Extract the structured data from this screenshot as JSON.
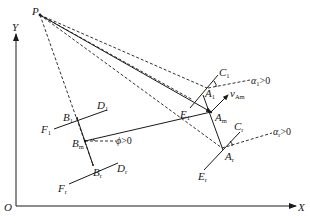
{
  "figure": {
    "type": "geometric-diagram",
    "background": "#ffffff",
    "stroke_color": "#1a1a1a"
  },
  "axes": {
    "origin_label": "O",
    "x_label": "X",
    "y_label": "Y"
  },
  "points": {
    "P": {
      "base": "P",
      "sub": ""
    },
    "C1": {
      "base": "C",
      "sub": "1"
    },
    "A1": {
      "base": "A",
      "sub": "1"
    },
    "Am": {
      "base": "A",
      "sub": "m"
    },
    "Ar": {
      "base": "A",
      "sub": "r"
    },
    "Cr": {
      "base": "C",
      "sub": "r"
    },
    "E1": {
      "base": "E",
      "sub": "1"
    },
    "Er": {
      "base": "E",
      "sub": "r"
    },
    "D1": {
      "base": "D",
      "sub": "1"
    },
    "Dr": {
      "base": "D",
      "sub": "r"
    },
    "B1": {
      "base": "B",
      "sub": "1"
    },
    "Bm": {
      "base": "B",
      "sub": "m"
    },
    "Br": {
      "base": "B",
      "sub": "r"
    },
    "F1": {
      "base": "F",
      "sub": "1"
    },
    "Fr": {
      "base": "F",
      "sub": "r"
    }
  },
  "vectors": {
    "vAm": {
      "base": "v",
      "sub": "Am"
    }
  },
  "angles": {
    "alpha1": {
      "symbol": "α",
      "sub": "1",
      "condition": ">0"
    },
    "alphar": {
      "symbol": "α",
      "sub": "r",
      "condition": ">0"
    },
    "phi": {
      "symbol": "ϕ",
      "sub": "",
      "condition": ">0"
    }
  }
}
